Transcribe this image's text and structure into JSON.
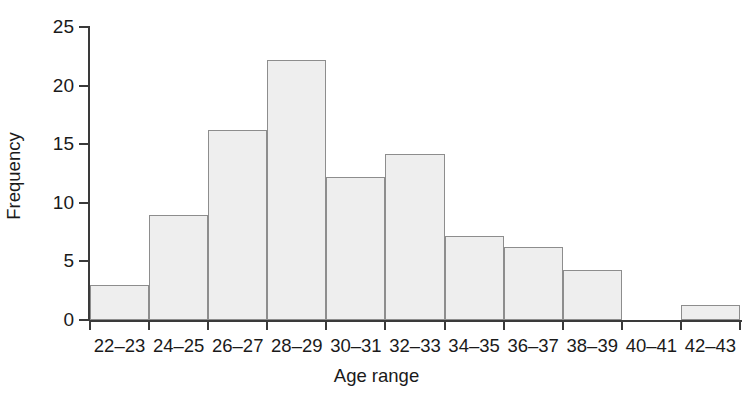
{
  "chart_data": {
    "type": "bar",
    "title": "",
    "subtitle": "",
    "xlabel": "Age range",
    "ylabel": "Frequency",
    "categories": [
      "22–23",
      "24–25",
      "26–27",
      "28–29",
      "30–31",
      "32–33",
      "34–35",
      "36–37",
      "38–39",
      "40–41",
      "42–43"
    ],
    "values": [
      3,
      9,
      16.2,
      22.2,
      12.2,
      14.2,
      7.2,
      6.2,
      4.3,
      0,
      1.3
    ],
    "ylim": [
      0,
      25
    ],
    "yticks": [
      0,
      5,
      10,
      15,
      20,
      25
    ],
    "ytick_labels": [
      "0",
      "5",
      "10",
      "15",
      "20",
      "25"
    ],
    "grid": false,
    "legend": false,
    "legend_position": "none",
    "bar_gap": 0,
    "colors": {
      "bar_fill": "#eeeeee",
      "bar_border": "#8d8d8d",
      "axis": "#3a3a3a",
      "text": "#1a1a1a",
      "background": "#ffffff"
    }
  }
}
